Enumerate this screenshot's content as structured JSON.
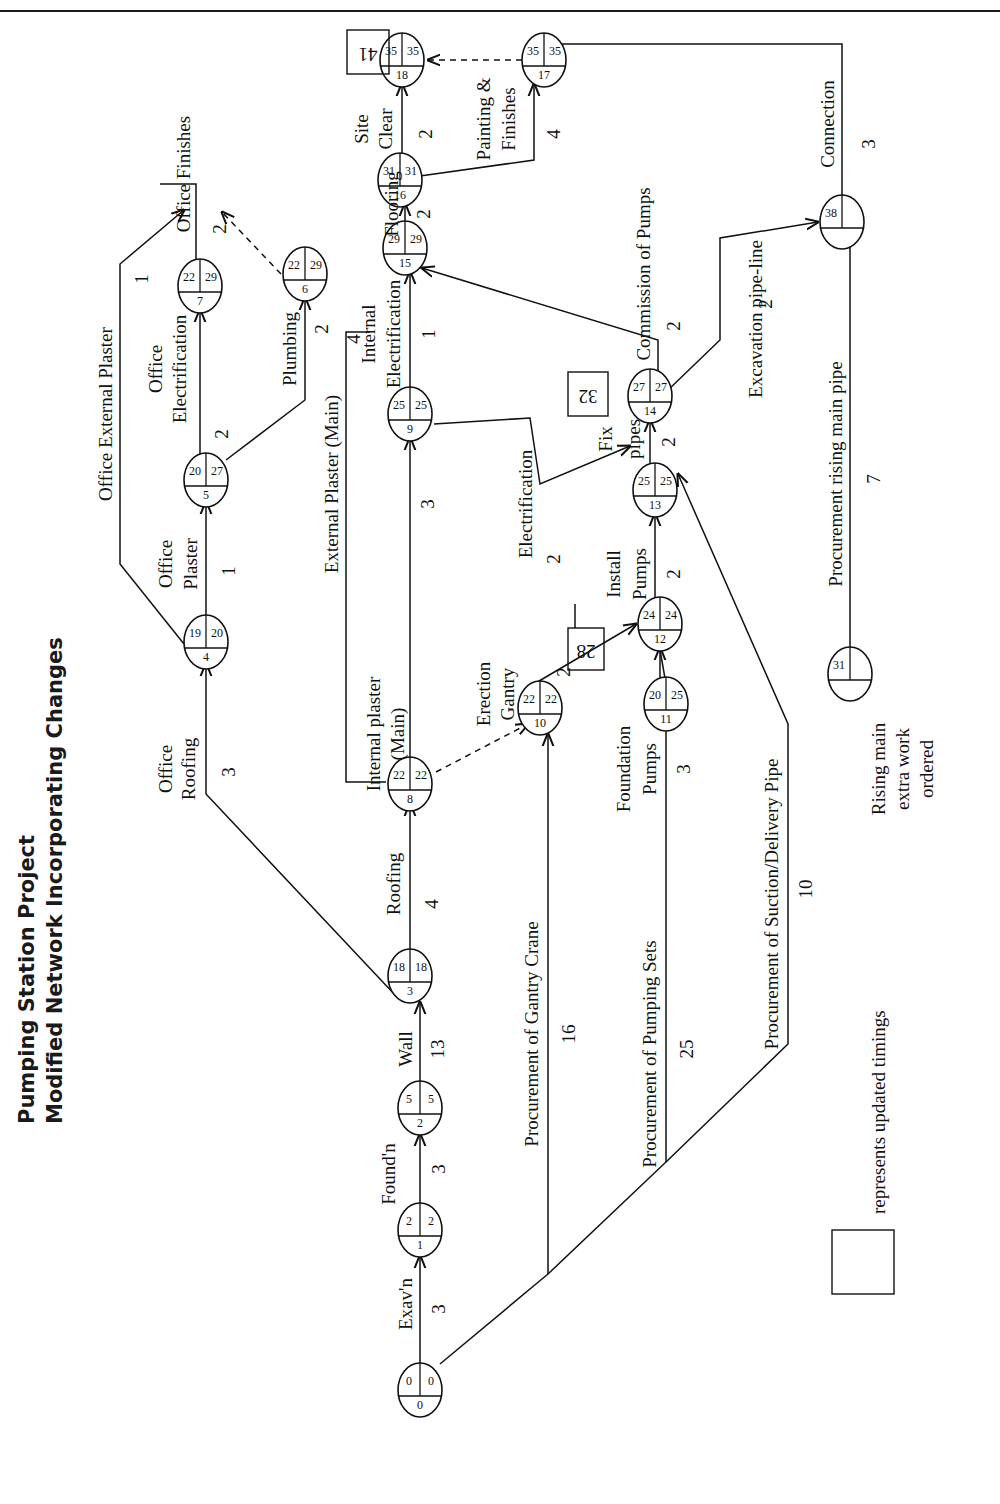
{
  "page": {
    "title_line_1": "Pumping Station Project",
    "title_line_2": "Modified Network Incorporating Changes"
  },
  "legend": {
    "box_meaning": "represents updated timings",
    "note": [
      "Rising main",
      "extra work",
      "ordered"
    ]
  },
  "nodes": [
    {
      "id": "0",
      "earliest": "0",
      "latest": "0",
      "note": "θ"
    },
    {
      "id": "1",
      "earliest": "2",
      "latest": "2"
    },
    {
      "id": "2",
      "earliest": "5",
      "latest": "5"
    },
    {
      "id": "3",
      "earliest": "18",
      "latest": "18"
    },
    {
      "id": "4",
      "earliest": "19",
      "latest": "20"
    },
    {
      "id": "5",
      "earliest": "20",
      "latest": "27"
    },
    {
      "id": "6",
      "earliest": "22",
      "latest": "29"
    },
    {
      "id": "7",
      "earliest": "22",
      "latest": "29"
    },
    {
      "id": "8",
      "earliest": "22",
      "latest": "22"
    },
    {
      "id": "9",
      "earliest": "25",
      "latest": "25"
    },
    {
      "id": "10",
      "earliest": "22",
      "latest": "22"
    },
    {
      "id": "11",
      "earliest": "20",
      "latest": "25"
    },
    {
      "id": "12",
      "earliest": "24",
      "latest": "24"
    },
    {
      "id": "13",
      "earliest": "25",
      "latest": "25"
    },
    {
      "id": "14",
      "earliest": "27",
      "latest": "27"
    },
    {
      "id": "15",
      "earliest": "29",
      "latest": "29"
    },
    {
      "id": "16",
      "earliest": "31",
      "latest": "31"
    },
    {
      "id": "17",
      "earliest": "35",
      "latest": "35"
    },
    {
      "id": "18",
      "earliest": "35",
      "latest": "35"
    },
    {
      "id": "",
      "earliest": "31",
      "latest": ""
    },
    {
      "id": "",
      "earliest": "38",
      "latest": ""
    }
  ],
  "updated_timings": [
    "41",
    "32",
    "28"
  ],
  "activities": [
    {
      "name": "Exav'n",
      "duration": "3",
      "from": "0",
      "to": "1"
    },
    {
      "name": "Found'n",
      "duration": "3",
      "from": "1",
      "to": "2"
    },
    {
      "name": "Wall",
      "duration": "13",
      "from": "2",
      "to": "3"
    },
    {
      "name": "Office Roofing",
      "duration": "3",
      "from": "3",
      "to": "4"
    },
    {
      "name": "Roofing",
      "duration": "4",
      "from": "3",
      "to": "8"
    },
    {
      "name": "Office Plaster",
      "duration": "1",
      "from": "4",
      "to": "5"
    },
    {
      "name": "Office External Plaster",
      "duration": "1",
      "from": "4",
      "to": "16"
    },
    {
      "name": "Office Electrification",
      "duration": "2",
      "from": "5",
      "to": "7"
    },
    {
      "name": "Plumbing",
      "duration": "2",
      "from": "5",
      "to": "6"
    },
    {
      "name": "Office Finishes",
      "duration": "2",
      "from": "7",
      "to": "16"
    },
    {
      "name": "Internal plaster (Main)",
      "duration": "3",
      "from": "8",
      "to": "9"
    },
    {
      "name": "External Plaster (Main)",
      "duration": "4",
      "from": "8",
      "to": "16"
    },
    {
      "name": "Internal Electrification",
      "duration": "1",
      "from": "9",
      "to": "15"
    },
    {
      "name": "Electrification",
      "duration": "2",
      "from": "9",
      "to": "14"
    },
    {
      "name": "Procurement of Gantry Crane",
      "duration": "16",
      "from": "0",
      "to": "10"
    },
    {
      "name": "Erection Gantry",
      "duration": "2",
      "from": "10",
      "to": "12"
    },
    {
      "name": "Procurement of Pumping Sets",
      "duration": "25",
      "from": "0",
      "to": "11"
    },
    {
      "name": "Foundation Pumps",
      "duration": "3",
      "from": "11",
      "to": "12"
    },
    {
      "name": "Install Pumps",
      "duration": "2",
      "from": "12",
      "to": "13"
    },
    {
      "name": "Procurement of Suction/Delivery Pipe",
      "duration": "10",
      "from": "0",
      "to": "13"
    },
    {
      "name": "Fix pipes",
      "duration": "2",
      "from": "13",
      "to": "14"
    },
    {
      "name": "Commission of Pumps",
      "duration": "2",
      "from": "14",
      "to": "15"
    },
    {
      "name": "Excavation pipe-line",
      "duration": "2",
      "from": "14",
      "to": "38"
    },
    {
      "name": "Procurement rising main pipe",
      "duration": "7",
      "from": "31",
      "to": "38"
    },
    {
      "name": "Connection",
      "duration": "3",
      "from": "38",
      "to": "17"
    },
    {
      "name": "Flooring",
      "duration": "2",
      "from": "15",
      "to": "16"
    },
    {
      "name": "Site Clear",
      "duration": "2",
      "from": "16",
      "to": "18"
    },
    {
      "name": "Painting & Finishes",
      "duration": "4",
      "from": "16",
      "to": "17"
    }
  ],
  "labels": {
    "exavn": "Exav'n",
    "foundn": "Found'n",
    "wall": "Wall",
    "office": "Office",
    "roofing": "Roofing",
    "plaster": "Plaster",
    "electrification": "Electrification",
    "office_ext_plaster": "Office External Plaster",
    "office_finishes": "Office Finishes",
    "plumbing": "Plumbing",
    "internal_plaster": "Internal plaster",
    "main_paren": "(Main)",
    "external_plaster_main": "External Plaster (Main)",
    "internal": "Internal",
    "flooring": "Flooring",
    "site": "Site",
    "clear": "Clear",
    "painting_amp": "Painting &",
    "finishes": "Finishes",
    "proc_gantry": "Procurement of Gantry Crane",
    "erection": "Erection",
    "gantry": "Gantry",
    "proc_pumping": "Procurement of Pumping Sets",
    "foundation": "Foundation",
    "pumps": "Pumps",
    "install": "Install",
    "fix": "Fix",
    "pipes": "pipes",
    "commission": "Commission of Pumps",
    "proc_suction": "Procurement of Suction/Delivery Pipe",
    "excavation_pl": "Excavation pipe-line",
    "proc_rising": "Procurement rising main pipe",
    "connection": "Connection"
  },
  "durations": {
    "exavn": "3",
    "foundn": "3",
    "wall": "13",
    "office_roofing": "3",
    "roofing": "4",
    "office_plaster": "1",
    "office_ext_plaster": "1",
    "office_elec": "2",
    "plumbing": "2",
    "office_finishes": "2",
    "internal_plaster": "3",
    "external_plaster": "4",
    "internal_elec": "1",
    "electrification": "2",
    "proc_gantry": "16",
    "erection": "2",
    "proc_pumping": "25",
    "foundation_pumps": "3",
    "install_pumps": "2",
    "proc_suction": "10",
    "fix_pipes": "2",
    "commission": "2",
    "excavation_pl": "2",
    "proc_rising": "7",
    "connection": "3",
    "flooring": "2",
    "site_clear": "2",
    "painting": "4"
  }
}
